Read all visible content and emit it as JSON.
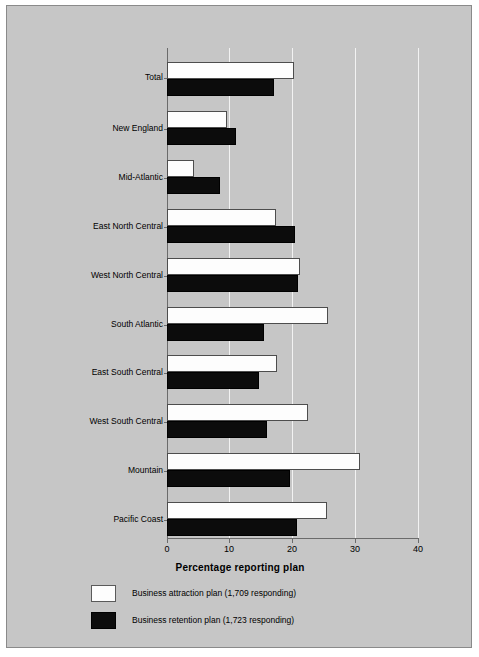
{
  "chart_data": {
    "type": "bar",
    "orientation": "horizontal",
    "title": "",
    "xlabel": "Percentage reporting plan",
    "ylabel": "",
    "xlim": [
      0,
      40
    ],
    "xticks": [
      0,
      10,
      20,
      30,
      40
    ],
    "xtick_labels": [
      "0",
      "10",
      "20",
      "30",
      "40"
    ],
    "grid": true,
    "grid_axis": "x",
    "legend_position": "below",
    "categories": [
      "Total",
      "New England",
      "Mid-Atlantic",
      "East North Central",
      "West North Central",
      "South Atlantic",
      "East South Central",
      "West South Central",
      "Mountain",
      "Pacific Coast"
    ],
    "series": [
      {
        "name": "Business attraction plan (1,709 responding)",
        "short_name": "Business attraction plan",
        "responding": "1,709",
        "color": "#ffffff",
        "values": [
          20.2,
          9.5,
          4.3,
          17.4,
          21.2,
          25.6,
          17.6,
          22.4,
          30.7,
          25.5
        ]
      },
      {
        "name": "Business retention plan (1,723 responding)",
        "short_name": "Business retention plan",
        "responding": "1,723",
        "color": "#000000",
        "values": [
          17.1,
          11.0,
          8.5,
          20.4,
          20.9,
          15.5,
          14.7,
          15.9,
          19.6,
          20.7
        ]
      }
    ]
  },
  "colors": {
    "figure_background": "#c6c6c6",
    "frame_border": "#8a8a8a",
    "axis": "#6b6b6b",
    "gridline": "#f2f2f2",
    "attraction_fill": "#ffffff",
    "retention_fill": "#000000"
  }
}
